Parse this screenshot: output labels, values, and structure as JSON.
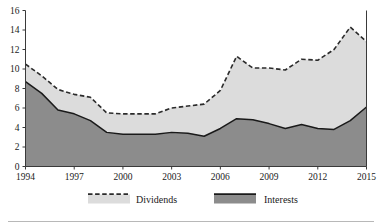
{
  "chart_data": {
    "type": "area",
    "title": "",
    "subtitle": "",
    "xlabel": "",
    "ylabel": "",
    "stacked": true,
    "grid": false,
    "legend_position": "bottom",
    "xlim": [
      1994,
      2015
    ],
    "ylim": [
      0,
      16
    ],
    "y_ticks": [
      0,
      2,
      4,
      6,
      8,
      10,
      12,
      14,
      16
    ],
    "y_tick_labels": [
      "0",
      "2",
      "4",
      "6",
      "8",
      "10",
      "12",
      "14",
      "16"
    ],
    "x_ticks": [
      1994,
      1997,
      2000,
      2003,
      2006,
      2009,
      2012,
      2015
    ],
    "x_tick_labels": [
      "1994",
      "1997",
      "2000",
      "2003",
      "2006",
      "2009",
      "2012",
      "2015"
    ],
    "x": [
      1994,
      1995,
      1996,
      1997,
      1998,
      1999,
      2000,
      2001,
      2002,
      2003,
      2004,
      2005,
      2006,
      2007,
      2008,
      2009,
      2010,
      2011,
      2012,
      2013,
      2014,
      2015
    ],
    "series": [
      {
        "name": "Interests",
        "color": "#8c8c8c",
        "line_color": "#1a1a1a",
        "line_style": "solid",
        "values": [
          8.7,
          7.5,
          5.8,
          5.4,
          4.7,
          3.5,
          3.3,
          3.3,
          3.3,
          3.5,
          3.4,
          3.1,
          3.9,
          4.9,
          4.8,
          4.4,
          3.9,
          4.3,
          3.9,
          3.8,
          4.7,
          6.1
        ]
      },
      {
        "name": "Dividends",
        "color": "#dcdcdc",
        "line_color": "#2b2b2b",
        "line_style": "dashed",
        "values": [
          1.8,
          1.8,
          2.1,
          2.0,
          2.4,
          2.0,
          2.1,
          2.1,
          2.1,
          2.5,
          2.8,
          3.3,
          3.9,
          6.4,
          5.3,
          5.7,
          6.0,
          6.7,
          7.0,
          8.2,
          9.6,
          6.7
        ]
      }
    ],
    "totals": [
      10.5,
      9.3,
      7.9,
      7.4,
      7.1,
      5.5,
      5.4,
      5.4,
      5.4,
      6.0,
      6.2,
      6.4,
      7.8,
      11.3,
      10.1,
      10.1,
      9.9,
      11.0,
      10.9,
      12.0,
      14.3,
      12.8
    ]
  },
  "legend": {
    "items": [
      {
        "label": "Dividends",
        "swatch": "#dcdcdc",
        "edge": "#2b2b2b",
        "style": "dashed"
      },
      {
        "label": "Interests",
        "swatch": "#8c8c8c",
        "edge": "#1a1a1a",
        "style": "solid"
      }
    ]
  }
}
